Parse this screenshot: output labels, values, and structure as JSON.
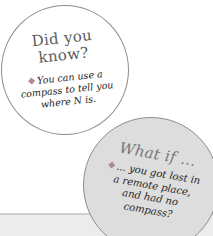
{
  "did_you_know": {
    "title_line1": "Did you",
    "title_line2": "know?",
    "lines": [
      "You can use a",
      "compass to tell you",
      "where N is."
    ],
    "bullet_icon": "diamond-bullet"
  },
  "what_if": {
    "title": "What if ...",
    "lines": [
      "... you got lost in",
      "a remote place,",
      "and had no",
      "compass?"
    ],
    "bullet_icon": "diamond-bullet"
  },
  "colors": {
    "circle_outline": "#8c8c8c",
    "what_if_fill": "#dddddd",
    "bullet": "#b08a90",
    "band": "#ececec"
  }
}
